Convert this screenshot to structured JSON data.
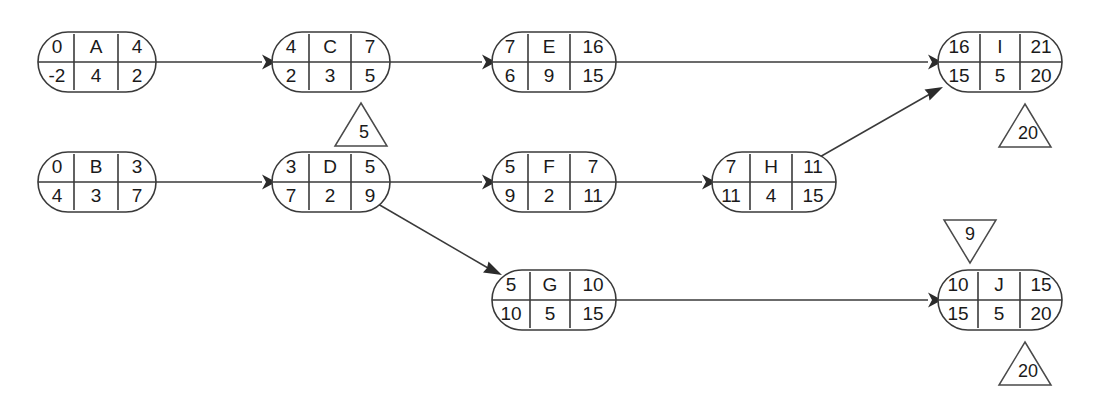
{
  "diagram": {
    "type": "activity-on-node-network",
    "row_labels": {
      "top": "0",
      "middle": "0",
      "bottom": "5"
    },
    "nodes": [
      {
        "id": "A",
        "label": "A",
        "early_start": "0",
        "early_finish": "4",
        "late_start": "-2",
        "duration": "4",
        "late_finish": "2",
        "x": 38,
        "y": 32,
        "w": 118,
        "h": 60
      },
      {
        "id": "C",
        "label": "C",
        "early_start": "4",
        "early_finish": "7",
        "late_start": "2",
        "duration": "3",
        "late_finish": "5",
        "x": 272,
        "y": 32,
        "w": 118,
        "h": 60
      },
      {
        "id": "E",
        "label": "E",
        "early_start": "7",
        "early_finish": "16",
        "late_start": "6",
        "duration": "9",
        "late_finish": "15",
        "x": 492,
        "y": 32,
        "w": 124,
        "h": 60
      },
      {
        "id": "I",
        "label": "I",
        "early_start": "16",
        "early_finish": "21",
        "late_start": "15",
        "duration": "5",
        "late_finish": "20",
        "x": 938,
        "y": 32,
        "w": 124,
        "h": 60
      },
      {
        "id": "B",
        "label": "B",
        "early_start": "0",
        "early_finish": "3",
        "late_start": "4",
        "duration": "3",
        "late_finish": "7",
        "x": 38,
        "y": 152,
        "w": 118,
        "h": 60
      },
      {
        "id": "D",
        "label": "D",
        "early_start": "3",
        "early_finish": "5",
        "late_start": "7",
        "duration": "2",
        "late_finish": "9",
        "x": 272,
        "y": 152,
        "w": 118,
        "h": 60
      },
      {
        "id": "F",
        "label": "F",
        "early_start": "5",
        "early_finish": "7",
        "late_start": "9",
        "duration": "2",
        "late_finish": "11",
        "x": 492,
        "y": 152,
        "w": 124,
        "h": 60
      },
      {
        "id": "H",
        "label": "H",
        "early_start": "7",
        "early_finish": "11",
        "late_start": "11",
        "duration": "4",
        "late_finish": "15",
        "x": 712,
        "y": 152,
        "w": 124,
        "h": 60
      },
      {
        "id": "G",
        "label": "G",
        "early_start": "5",
        "early_finish": "10",
        "late_start": "10",
        "duration": "5",
        "late_finish": "15",
        "x": 492,
        "y": 270,
        "w": 124,
        "h": 60
      },
      {
        "id": "J",
        "label": "J",
        "early_start": "10",
        "early_finish": "15",
        "late_start": "15",
        "duration": "5",
        "late_finish": "20",
        "x": 938,
        "y": 270,
        "w": 124,
        "h": 60
      }
    ],
    "edges": [
      {
        "id": "A-C",
        "from": "A",
        "to": "C",
        "kind": "straight"
      },
      {
        "id": "C-E",
        "from": "C",
        "to": "E",
        "kind": "straight"
      },
      {
        "id": "E-I",
        "from": "E",
        "to": "I",
        "kind": "straight"
      },
      {
        "id": "B-D",
        "from": "B",
        "to": "D",
        "kind": "straight"
      },
      {
        "id": "D-F",
        "from": "D",
        "to": "F",
        "kind": "straight"
      },
      {
        "id": "F-H",
        "from": "F",
        "to": "H",
        "kind": "straight"
      },
      {
        "id": "H-I",
        "from": "H",
        "to": "I",
        "kind": "diagonal-up"
      },
      {
        "id": "D-G",
        "from": "D",
        "to": "G",
        "kind": "diagonal-down"
      },
      {
        "id": "G-J",
        "from": "G",
        "to": "J",
        "kind": "straight"
      }
    ],
    "milestones": [
      {
        "id": "m-c",
        "value": "5",
        "direction": "up",
        "near_node": "C",
        "cx": 361,
        "cy": 125
      },
      {
        "id": "m-i",
        "value": "20",
        "direction": "up",
        "near_node": "I",
        "cx": 1025,
        "cy": 126
      },
      {
        "id": "m-j-top",
        "value": "9",
        "direction": "down",
        "near_node": "J",
        "cx": 970,
        "cy": 241
      },
      {
        "id": "m-j-bottom",
        "value": "20",
        "direction": "up",
        "near_node": "J",
        "cx": 1025,
        "cy": 364
      }
    ],
    "colors": {
      "stroke": "#3a3a3a",
      "text": "#1a1a1a",
      "background": "#ffffff",
      "arrow": "#2b2b2b"
    }
  }
}
